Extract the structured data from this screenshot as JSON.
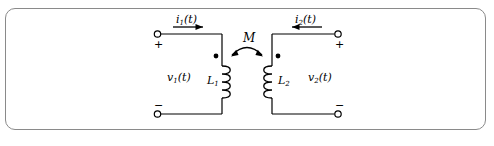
{
  "figure": {
    "type": "circuit-diagram",
    "frame_color": "#8a8a8a",
    "line_color": "#000000",
    "background": "#ffffff"
  },
  "labels": {
    "current_left": "i",
    "current_left_sub": "1",
    "current_left_arg": "(t)",
    "current_right": "i",
    "current_right_sub": "2",
    "current_right_arg": "(t)",
    "voltage_left": "v",
    "voltage_left_sub": "1",
    "voltage_left_arg": "(t)",
    "voltage_right": "v",
    "voltage_right_sub": "2",
    "voltage_right_arg": "(t)",
    "inductor_left": "L",
    "inductor_left_sub": "1",
    "inductor_right": "L",
    "inductor_right_sub": "2",
    "mutual_inductance": "M",
    "plus_left": "+",
    "minus_left": "−",
    "plus_right": "+",
    "minus_right": "−"
  },
  "elements": {
    "terminal_top_left": "open-terminal",
    "terminal_bottom_left": "open-terminal",
    "terminal_top_right": "open-terminal",
    "terminal_bottom_right": "open-terminal",
    "dot_left": "polarity-dot",
    "dot_right": "polarity-dot",
    "coil_left": "inductor-coil",
    "coil_right": "inductor-coil",
    "coupling_arc": "double-headed-arc"
  }
}
